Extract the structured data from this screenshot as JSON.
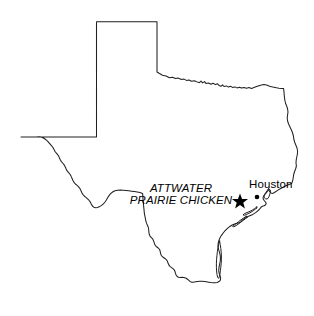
{
  "figure": {
    "kind": "map",
    "region": "Texas",
    "background_color": "#ffffff",
    "outline_color": "#231f20"
  },
  "labels": {
    "species": {
      "line1": "ATTWATER",
      "line2": "PRAIRIE CHICKEN"
    },
    "city": {
      "name": "Houston"
    }
  },
  "markers": [
    {
      "name": "attwater-prairie-chicken-star",
      "symbol": "star",
      "x": 240,
      "y": 200,
      "color": "#000000"
    },
    {
      "name": "houston-dot",
      "symbol": "dot",
      "x": 257,
      "y": 197,
      "color": "#000000"
    }
  ]
}
